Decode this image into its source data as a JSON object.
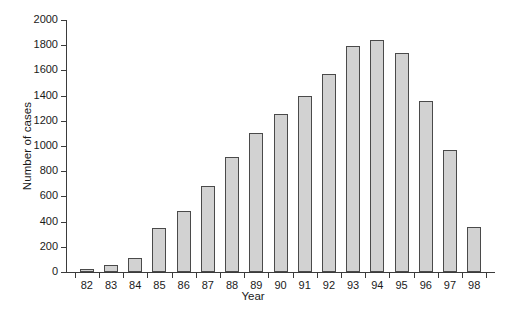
{
  "chart_data": {
    "type": "bar",
    "title": "",
    "xlabel": "Year",
    "ylabel": "Number of cases",
    "categories": [
      "82",
      "83",
      "84",
      "85",
      "86",
      "87",
      "88",
      "89",
      "90",
      "91",
      "92",
      "93",
      "94",
      "95",
      "96",
      "97",
      "98"
    ],
    "values": [
      25,
      55,
      115,
      350,
      485,
      685,
      915,
      1100,
      1255,
      1400,
      1570,
      1790,
      1840,
      1740,
      1355,
      965,
      355
    ],
    "ylim": [
      0,
      2000
    ],
    "ytick_labels": [
      "0",
      "200",
      "400",
      "600",
      "800",
      "1000",
      "1200",
      "1400",
      "1600",
      "1800",
      "2000"
    ],
    "ytick_values": [
      0,
      200,
      400,
      600,
      800,
      1000,
      1200,
      1400,
      1600,
      1800,
      2000
    ],
    "grid": false,
    "legend": null,
    "bar_color": "#d2d2d2",
    "bar_edge_color": "#4a4a4a",
    "axis_color": "#3b3b3b",
    "background": "#ffffff"
  }
}
